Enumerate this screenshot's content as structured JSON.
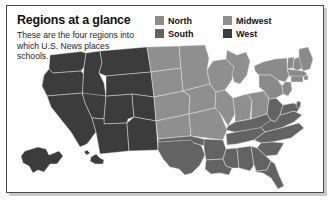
{
  "card": {
    "title": "Regions at a glance",
    "blurb": "These are the four regions into which U.S. News places schools."
  },
  "legend": {
    "items": [
      {
        "label": "North",
        "color": "#8a8a8a",
        "key": "north"
      },
      {
        "label": "Midwest",
        "color": "#8f8f8f",
        "key": "midwest"
      },
      {
        "label": "South",
        "color": "#636363",
        "key": "south"
      },
      {
        "label": "West",
        "color": "#3c3c3c",
        "key": "west"
      }
    ]
  },
  "map": {
    "alt": "United States map shaded by region",
    "region_colors": {
      "north": "#8a8a8a",
      "midwest": "#8f8f8f",
      "south": "#636363",
      "west": "#3c3c3c"
    },
    "regions": [
      {
        "key": "west",
        "label": "West",
        "states": [
          "Washington",
          "Oregon",
          "California",
          "Idaho",
          "Nevada",
          "Utah",
          "Arizona",
          "Montana",
          "Wyoming",
          "Colorado",
          "New Mexico",
          "Alaska",
          "Hawaii"
        ]
      },
      {
        "key": "midwest",
        "label": "Midwest",
        "states": [
          "North Dakota",
          "South Dakota",
          "Nebraska",
          "Kansas",
          "Minnesota",
          "Iowa",
          "Missouri",
          "Wisconsin",
          "Illinois",
          "Michigan",
          "Indiana",
          "Ohio"
        ]
      },
      {
        "key": "south",
        "label": "South",
        "states": [
          "Texas",
          "Oklahoma",
          "Arkansas",
          "Louisiana",
          "Mississippi",
          "Alabama",
          "Tennessee",
          "Kentucky",
          "West Virginia",
          "Virginia",
          "North Carolina",
          "South Carolina",
          "Georgia",
          "Florida",
          "Maryland",
          "Delaware",
          "District of Columbia"
        ]
      },
      {
        "key": "north",
        "label": "North",
        "states": [
          "Maine",
          "New Hampshire",
          "Vermont",
          "Massachusetts",
          "Rhode Island",
          "Connecticut",
          "New York",
          "New Jersey",
          "Pennsylvania"
        ]
      }
    ]
  },
  "style": {
    "frame_border": "#4a4a4a",
    "background": "#ffffff",
    "state_outline": "#e8e8e8",
    "text": "#111111"
  }
}
